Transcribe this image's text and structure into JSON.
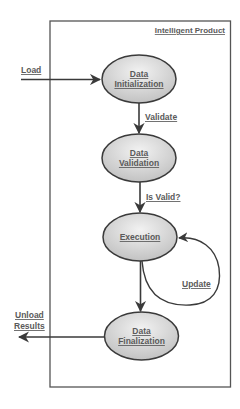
{
  "container": {
    "title": "Intelligent Product"
  },
  "nodes": [
    {
      "id": "init",
      "line1": "Data",
      "line2": "Initialization"
    },
    {
      "id": "validation",
      "line1": "Data",
      "line2": "Validation"
    },
    {
      "id": "execution",
      "line1": "Execution",
      "line2": ""
    },
    {
      "id": "finalization",
      "line1": "Data",
      "line2": "Finalization"
    }
  ],
  "edges": {
    "load": "Load",
    "validate": "Validate",
    "is_valid": "Is Valid?",
    "update": "Update",
    "unload_line1": "Unload",
    "unload_line2": "Results"
  },
  "colors": {
    "stroke": "#3a3a3a",
    "fill_light": "#eeeeee",
    "fill_dark": "#c4c4c4",
    "text": "#5a5a5a"
  }
}
